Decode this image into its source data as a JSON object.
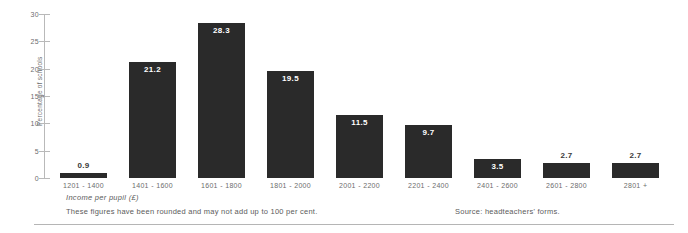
{
  "chart_data": {
    "type": "bar",
    "title": "",
    "xlabel": "Income per pupil (£)",
    "ylabel": "Percentage of schools",
    "ylim": [
      0,
      30
    ],
    "yticks": [
      0,
      5,
      10,
      15,
      20,
      25,
      30
    ],
    "grid": false,
    "legend": "none",
    "categories": [
      "1201 - 1400",
      "1401 - 1600",
      "1601 - 1800",
      "1801 - 2000",
      "2001 - 2200",
      "2201 - 2400",
      "2401 - 2600",
      "2601 - 2800",
      "2801 +"
    ],
    "values": [
      0.9,
      21.2,
      28.3,
      19.5,
      11.5,
      9.7,
      3.5,
      2.7,
      2.7
    ],
    "value_labels": [
      "0.9",
      "21.2",
      "28.3",
      "19.5",
      "11.5",
      "9.7",
      "3.5",
      "2.7",
      "2.7"
    ],
    "bar_color": "#2a2a2a",
    "value_label_color": "#ffffff",
    "axis_color": "#b9b9b9",
    "text_color": "#6d6d6d"
  },
  "notes": {
    "footnote": "These figures have been rounded and may not add up to 100 per cent.",
    "source": "Source: headteachers' forms."
  }
}
